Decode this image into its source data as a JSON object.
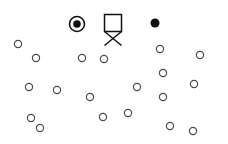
{
  "canvas": {
    "width": 228,
    "height": 144,
    "background": "#ffffff"
  },
  "style": {
    "open_stroke": "#4a4a4a",
    "open_fill": "none",
    "filled_color": "#111111",
    "ring_stroke": "#111111",
    "chair_stroke": "#111111",
    "open_diameter": 7.2,
    "open_stroke_width": 1.2
  },
  "chart_data": {
    "type": "scatter",
    "title": "",
    "subtitle": "",
    "xlabel": "",
    "ylabel": "",
    "grid": false,
    "axes_visible": false,
    "legend_position": "none",
    "xlim": [
      0,
      228
    ],
    "ylim": [
      0,
      144
    ],
    "y_axis_direction": "down",
    "coordinate_space": "pixels",
    "series": [
      {
        "name": "ringed-dot-marker",
        "symbol": "circle-with-filled-center",
        "marker_style": "open ring enclosing a filled dot",
        "count": 1,
        "points": [
          {
            "x": 77,
            "y": 24,
            "outer_diameter": 15,
            "inner_diameter": 7.5
          }
        ]
      },
      {
        "name": "chair-marker",
        "symbol": "square-over-cross",
        "marker_style": "open square above an X / bowtie crossing",
        "count": 1,
        "points": [
          {
            "x": 113,
            "y": 25,
            "square_size": 17,
            "cross_height": 14
          }
        ]
      },
      {
        "name": "filled-dot-marker",
        "symbol": "filled-circle",
        "marker_style": "solid black dot",
        "count": 1,
        "points": [
          {
            "x": 155,
            "y": 23,
            "diameter": 9
          }
        ]
      },
      {
        "name": "open-circle-markers",
        "symbol": "open-circle",
        "marker_style": "small unfilled circle outline",
        "count": 24,
        "points": [
          {
            "x": 18,
            "y": 44
          },
          {
            "x": 36,
            "y": 58
          },
          {
            "x": 82,
            "y": 58
          },
          {
            "x": 104,
            "y": 59
          },
          {
            "x": 160,
            "y": 49
          },
          {
            "x": 200,
            "y": 55
          },
          {
            "x": 163,
            "y": 73
          },
          {
            "x": 29,
            "y": 87
          },
          {
            "x": 57,
            "y": 90
          },
          {
            "x": 137,
            "y": 87
          },
          {
            "x": 194,
            "y": 84
          },
          {
            "x": 90,
            "y": 97
          },
          {
            "x": 163,
            "y": 97
          },
          {
            "x": 31,
            "y": 118
          },
          {
            "x": 40,
            "y": 128
          },
          {
            "x": 103,
            "y": 117
          },
          {
            "x": 128,
            "y": 113
          },
          {
            "x": 170,
            "y": 126
          },
          {
            "x": 193,
            "y": 131
          }
        ]
      }
    ]
  }
}
